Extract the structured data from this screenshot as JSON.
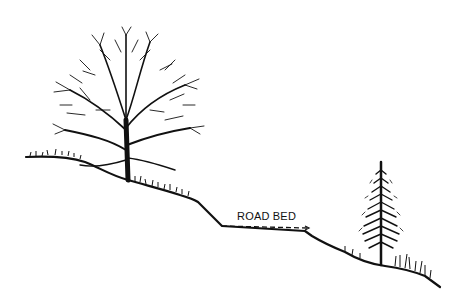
{
  "diagram": {
    "type": "slope-cross-section-illustration",
    "labels": {
      "road_bed": "ROAD BED"
    },
    "elements": [
      {
        "name": "deciduous-tree",
        "position": "upper-left slope"
      },
      {
        "name": "road-bed",
        "position": "middle bench",
        "style": "dashed line"
      },
      {
        "name": "conifer-tree",
        "position": "lower-right slope"
      }
    ],
    "colors": {
      "ink": "#111111",
      "background": "#ffffff"
    }
  }
}
